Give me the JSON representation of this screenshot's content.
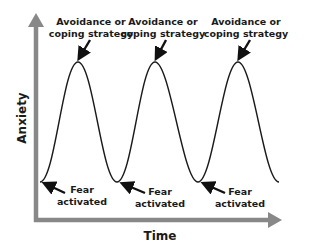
{
  "diagram": {
    "type": "cycle-curve",
    "axes": {
      "y_label": "Anxiety",
      "x_label": "Time",
      "color": "#888888"
    },
    "curve_color": "#1a1a1a",
    "peaks": [
      {
        "label_line1": "Avoidance or",
        "label_line2": "coping strategy"
      },
      {
        "label_line1": "Avoidance or",
        "label_line2": "coping strategy"
      },
      {
        "label_line1": "Avoidance or",
        "label_line2": "coping strategy"
      }
    ],
    "troughs": [
      {
        "label_line1": "Fear",
        "label_line2": "activated"
      },
      {
        "label_line1": "Fear",
        "label_line2": "activated"
      },
      {
        "label_line1": "Fear",
        "label_line2": "activated"
      }
    ]
  }
}
